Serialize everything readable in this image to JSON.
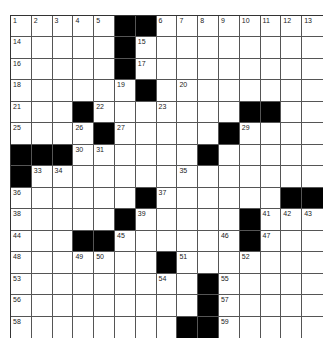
{
  "puzzle": {
    "rows": 15,
    "cols": 15,
    "grid": [
      "11111##11111111",
      "11111#111111111",
      "11111#111111111",
      "111111#11111111",
      "111#1111111##111",
      "1111#11111#11111",
      "###111111#111111",
      "#11111111111111#",
      "111111#111111###",
      "11111#11111#1111",
      "111##111111#1111",
      "1111111#1111111",
      "111111111#11111",
      "111111111#11111",
      "11111111##11111"
    ],
    "numbers": [
      {
        "r": 0,
        "c": 0,
        "n": "1"
      },
      {
        "r": 0,
        "c": 1,
        "n": "2"
      },
      {
        "r": 0,
        "c": 2,
        "n": "3"
      },
      {
        "r": 0,
        "c": 3,
        "n": "4"
      },
      {
        "r": 0,
        "c": 4,
        "n": "5"
      },
      {
        "r": 0,
        "c": 7,
        "n": "6"
      },
      {
        "r": 0,
        "c": 8,
        "n": "7"
      },
      {
        "r": 0,
        "c": 9,
        "n": "8"
      },
      {
        "r": 0,
        "c": 10,
        "n": "9"
      },
      {
        "r": 0,
        "c": 11,
        "n": "10"
      },
      {
        "r": 0,
        "c": 12,
        "n": "11"
      },
      {
        "r": 0,
        "c": 13,
        "n": "12"
      },
      {
        "r": 0,
        "c": 14,
        "n": "13"
      },
      {
        "r": 1,
        "c": 0,
        "n": "14"
      },
      {
        "r": 1,
        "c": 6,
        "n": "15"
      },
      {
        "r": 2,
        "c": 0,
        "n": "16"
      },
      {
        "r": 2,
        "c": 6,
        "n": "17"
      },
      {
        "r": 3,
        "c": 0,
        "n": "18"
      },
      {
        "r": 3,
        "c": 5,
        "n": "19"
      },
      {
        "r": 3,
        "c": 8,
        "n": "20"
      },
      {
        "r": 4,
        "c": 0,
        "n": "21"
      },
      {
        "r": 4,
        "c": 4,
        "n": "22"
      },
      {
        "r": 4,
        "c": 7,
        "n": "23"
      },
      {
        "r": 4,
        "c": 12,
        "n": "24"
      },
      {
        "r": 5,
        "c": 0,
        "n": "25"
      },
      {
        "r": 5,
        "c": 3,
        "n": "26"
      },
      {
        "r": 5,
        "c": 5,
        "n": "27"
      },
      {
        "r": 5,
        "c": 10,
        "n": "28"
      },
      {
        "r": 5,
        "c": 11,
        "n": "29"
      },
      {
        "r": 6,
        "c": 3,
        "n": "30"
      },
      {
        "r": 6,
        "c": 4,
        "n": "31"
      },
      {
        "r": 6,
        "c": 9,
        "n": "32"
      },
      {
        "r": 7,
        "c": 1,
        "n": "33"
      },
      {
        "r": 7,
        "c": 2,
        "n": "34"
      },
      {
        "r": 7,
        "c": 8,
        "n": "35"
      },
      {
        "r": 8,
        "c": 0,
        "n": "36"
      },
      {
        "r": 8,
        "c": 7,
        "n": "37"
      },
      {
        "r": 9,
        "c": 0,
        "n": "38"
      },
      {
        "r": 9,
        "c": 6,
        "n": "39"
      },
      {
        "r": 9,
        "c": 11,
        "n": "40"
      },
      {
        "r": 9,
        "c": 12,
        "n": "41"
      },
      {
        "r": 9,
        "c": 13,
        "n": "42"
      },
      {
        "r": 9,
        "c": 14,
        "n": "43"
      },
      {
        "r": 10,
        "c": 0,
        "n": "44"
      },
      {
        "r": 10,
        "c": 5,
        "n": "45"
      },
      {
        "r": 10,
        "c": 10,
        "n": "46"
      },
      {
        "r": 10,
        "c": 12,
        "n": "47"
      },
      {
        "r": 11,
        "c": 0,
        "n": "48"
      },
      {
        "r": 11,
        "c": 3,
        "n": "49"
      },
      {
        "r": 11,
        "c": 4,
        "n": "50"
      },
      {
        "r": 11,
        "c": 8,
        "n": "51"
      },
      {
        "r": 11,
        "c": 11,
        "n": "52"
      },
      {
        "r": 12,
        "c": 0,
        "n": "53"
      },
      {
        "r": 12,
        "c": 7,
        "n": "54"
      },
      {
        "r": 12,
        "c": 10,
        "n": "55"
      },
      {
        "r": 13,
        "c": 0,
        "n": "56"
      },
      {
        "r": 13,
        "c": 10,
        "n": "57"
      },
      {
        "r": 14,
        "c": 0,
        "n": "58"
      },
      {
        "r": 14,
        "c": 10,
        "n": "59"
      }
    ]
  }
}
